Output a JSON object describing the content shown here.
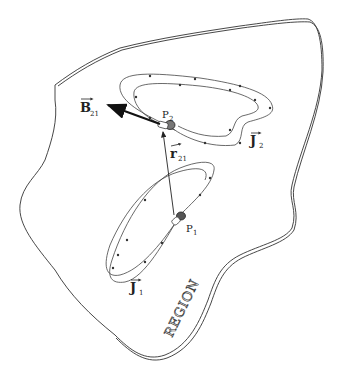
{
  "diagram": {
    "labels": {
      "B": {
        "main": "B",
        "sub": "21"
      },
      "r": {
        "main": "r",
        "sub": "21"
      },
      "J1": {
        "main": "J",
        "sub": "1"
      },
      "J2": {
        "main": "J",
        "sub": "2"
      },
      "P1": {
        "main": "P",
        "sub": "1"
      },
      "P2": {
        "main": "P",
        "sub": "2"
      },
      "region": "REGION"
    }
  }
}
